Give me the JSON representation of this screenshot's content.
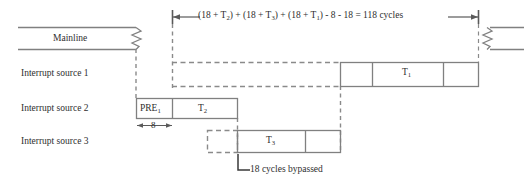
{
  "diagram": {
    "title_annotation": {
      "parts": [
        "(18 + T",
        "2",
        ") + (18 + T",
        "3",
        ") + (18 + T",
        "1",
        ") - 8 - 18 = 118 cycles"
      ],
      "plain_text": "(18 + T2) + (18 + T3) + (18 + T1) - 8 - 18 = 118 cycles"
    },
    "rows": [
      {
        "label": "Mainline"
      },
      {
        "label": "Interrupt source 1"
      },
      {
        "label": "Interrupt source 2"
      },
      {
        "label": "Interrupt source 3"
      }
    ],
    "blocks": {
      "mainline_bar": "Mainline",
      "pre1_prefix": "PRE",
      "pre1_sub": "1",
      "t2_prefix": "T",
      "t2_sub": "2",
      "t3_prefix": "T",
      "t3_sub": "3",
      "t1_prefix": "T",
      "t1_sub": "1"
    },
    "dimensions": {
      "eight_cycles": "8"
    },
    "callouts": {
      "bypassed": "18 cycles bypassed"
    },
    "colors": {
      "line": "#808080",
      "dark_line": "#6a6a6a",
      "text": "#2e2e2e",
      "background": "#ffffff"
    }
  }
}
